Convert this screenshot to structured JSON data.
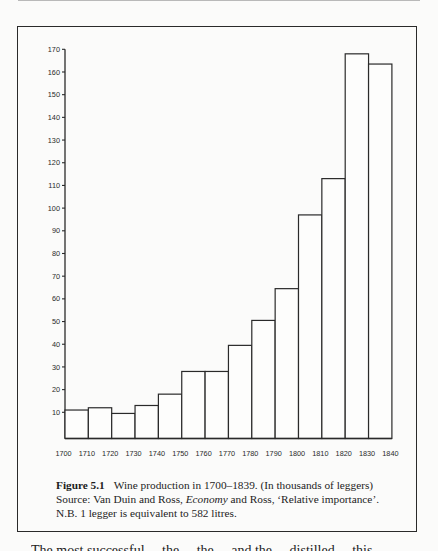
{
  "chart_data": {
    "type": "bar",
    "title": "Wine production in 1700–1839. (In thousands of leggers)",
    "xlabel": "",
    "ylabel": "",
    "categories": [
      "1700",
      "1710",
      "1720",
      "1730",
      "1740",
      "1750",
      "1760",
      "1770",
      "1780",
      "1790",
      "1800",
      "1810",
      "1820",
      "1830"
    ],
    "x_tick_labels": [
      "1700",
      "1710",
      "1720",
      "1730",
      "1740",
      "1750",
      "1760",
      "1770",
      "1780",
      "1790",
      "1800",
      "1810",
      "1820",
      "1830",
      "1840"
    ],
    "values": [
      11,
      12,
      9.5,
      13,
      18,
      28,
      28,
      39.5,
      50.5,
      64.5,
      97,
      113,
      168,
      163.5
    ],
    "y_ticks": [
      10,
      20,
      30,
      40,
      50,
      60,
      70,
      80,
      90,
      100,
      110,
      120,
      130,
      140,
      150,
      160,
      170
    ],
    "ylim": [
      0,
      170
    ],
    "grid": false,
    "legend": null
  },
  "caption": {
    "figure_label": "Figure 5.1",
    "title": "Wine production in 1700–1839. (In thousands of leggers)",
    "source_prefix": "Source: Van Duin and Ross, ",
    "source_italic": "Economy",
    "source_suffix": " and Ross, ‘Relative importance’.",
    "note": "N.B. 1 legger is equivalent to 582 litres."
  },
  "body_text": {
    "partial_line": "The most successful ... the ... the ... and the ... distilled ... this"
  }
}
